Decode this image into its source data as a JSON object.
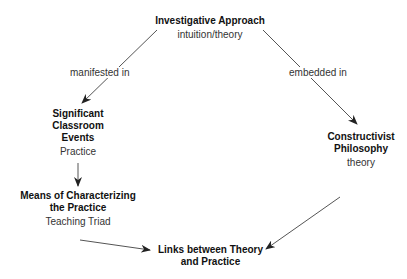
{
  "nodes": {
    "investigative": {
      "title": "Investigative Approach",
      "sub": "intuition/theory"
    },
    "events": {
      "title_lines": [
        "Significant",
        "Classroom",
        "Events"
      ],
      "sub": "Practice"
    },
    "means": {
      "title_lines": [
        "Means of Characterizing",
        "the Practice"
      ],
      "sub": "Teaching Triad"
    },
    "constructivist": {
      "title_lines": [
        "Constructivist",
        "Philosophy"
      ],
      "sub": "theory"
    },
    "links": {
      "title_lines": [
        "Links between Theory",
        "and Practice"
      ]
    }
  },
  "edges": {
    "manifested": "manifested in",
    "embedded": "embedded  in"
  },
  "colors": {
    "line": "#555555",
    "text": "#111111"
  }
}
